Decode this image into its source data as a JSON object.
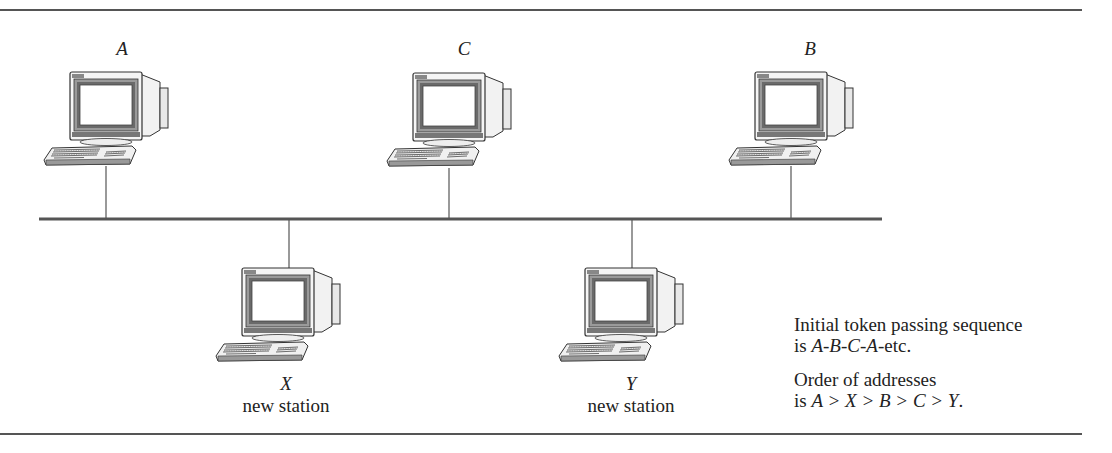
{
  "figure": {
    "stations": [
      {
        "id": "A",
        "label": "A",
        "subtitle": "",
        "position": "top"
      },
      {
        "id": "C",
        "label": "C",
        "subtitle": "",
        "position": "top"
      },
      {
        "id": "B",
        "label": "B",
        "subtitle": "",
        "position": "top"
      },
      {
        "id": "X",
        "label": "X",
        "subtitle": "new station",
        "position": "bottom"
      },
      {
        "id": "Y",
        "label": "Y",
        "subtitle": "new station",
        "position": "bottom"
      }
    ],
    "notes": {
      "sequence_line1": "Initial token passing sequence",
      "sequence_line2_prefix": "is ",
      "sequence_line2_value": "A-B-C-A",
      "sequence_line2_suffix": "-etc.",
      "order_line1": "Order of addresses",
      "order_line2_prefix": "is ",
      "order_line2_value": "A > X > B > C > Y",
      "order_line2_suffix": "."
    },
    "colors": {
      "line": "#555555",
      "text": "#222222",
      "background": "#ffffff"
    }
  }
}
